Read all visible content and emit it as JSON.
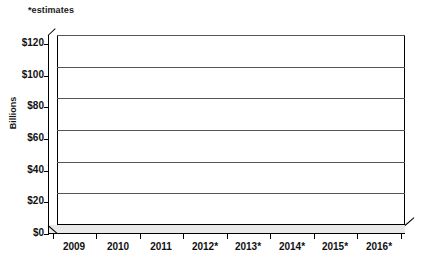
{
  "chart_data": {
    "type": "bar",
    "title": "",
    "subtitle": "",
    "annotation": "*estimates",
    "xlabel": "",
    "ylabel": "Billions",
    "categories": [
      "2009",
      "2010",
      "2011",
      "2012*",
      "2013*",
      "2014*",
      "2015*",
      "2016*"
    ],
    "values": [
      51,
      110,
      27,
      22,
      14,
      9,
      6,
      3
    ],
    "series": [
      {
        "name": "Billions",
        "values": [
          51,
          110,
          27,
          22,
          14,
          9,
          6,
          3
        ]
      }
    ],
    "ylim": [
      0,
      120
    ],
    "ytick_values": [
      0,
      20,
      40,
      60,
      80,
      100,
      120
    ],
    "ytick_labels": [
      "$0",
      "$20",
      "$40",
      "$60",
      "$80",
      "$100",
      "$120"
    ],
    "grid": true,
    "grid_axis": "y",
    "legend": false,
    "legend_position": "none",
    "style": "3d-column",
    "colors": {
      "bar_front": "#4d4d4d",
      "bar_top": "#6e6e6e",
      "bar_side": "#2e2e2e",
      "gridline": "#555555",
      "axis": "#000000",
      "plot_background": "#ffffff",
      "floor": "#e9e9e9",
      "text": "#111111"
    }
  },
  "axes": {
    "y_title": "Billions",
    "y_labels": [
      "$120",
      "$100",
      "$80",
      "$60",
      "$40",
      "$20",
      "$0"
    ],
    "x_labels": [
      "2009",
      "2010",
      "2011",
      "2012*",
      "2013*",
      "2014*",
      "2015*",
      "2016*"
    ]
  },
  "notes": {
    "estimates": "*estimates"
  }
}
